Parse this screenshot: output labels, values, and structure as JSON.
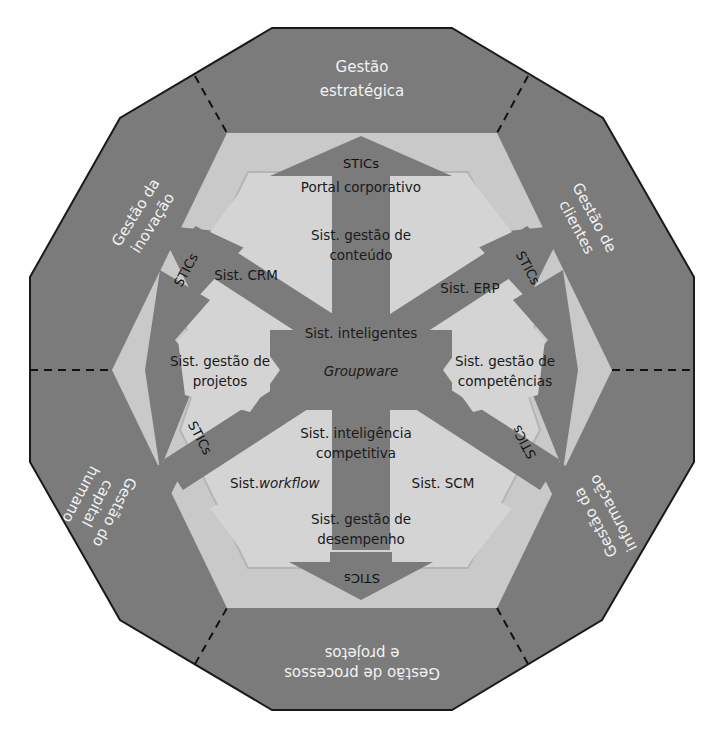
{
  "colors": {
    "outer_ring": "#7a7a7a",
    "light_band": "#c8c8c8",
    "inner_panel": "#d3d3d3",
    "arrow": "#7a7a7a",
    "outline": "#1a1a1a",
    "outer_text": "#f2f2f2",
    "inner_text": "#1a1a1a"
  },
  "outer_segments": {
    "top": {
      "line1": "Gestão",
      "line2": "estratégica"
    },
    "upper_right": {
      "line1": "Gestão de",
      "line2": "clientes"
    },
    "lower_right": {
      "line1": "Gestão da",
      "line2": "informação"
    },
    "bottom": {
      "line1": "Gestão de processos",
      "line2": "e projetos"
    },
    "lower_left": {
      "line1": "Gestão do",
      "line2": "capital",
      "line3": "humano"
    },
    "upper_left": {
      "line1": "Gestão da",
      "line2": "inovação"
    }
  },
  "arrow_labels": {
    "top": "STICs",
    "upper_right": "STICs",
    "lower_right": "STICs",
    "bottom": "STICs",
    "lower_left": "STICs",
    "upper_left": "STICs"
  },
  "center": {
    "portal": "Portal corporativo",
    "content_l1": "Sist. gestão de",
    "content_l2": "conteúdo",
    "crm": "Sist. CRM",
    "erp": "Sist. ERP",
    "intelligent": "Sist. inteligentes",
    "groupware": "Groupware",
    "projects_l1": "Sist. gestão de",
    "projects_l2": "projetos",
    "competencies_l1": "Sist. gestão de",
    "competencies_l2": "competências",
    "ci_l1": "Sist. inteligência",
    "ci_l2": "competitiva",
    "workflow_prefix": "Sist.",
    "workflow_italic": "workflow",
    "scm": "Sist. SCM",
    "performance_l1": "Sist. gestão de",
    "performance_l2": "desempenho"
  }
}
